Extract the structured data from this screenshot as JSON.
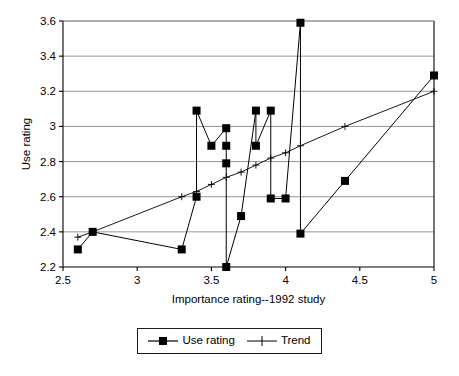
{
  "chart_data": {
    "type": "scatter",
    "title": "",
    "xlabel": "Importance rating--1992 study",
    "ylabel": "Use rating",
    "xlim": [
      2.5,
      5
    ],
    "ylim": [
      2.2,
      3.6
    ],
    "xticks": [
      "2.5",
      "3",
      "3.5",
      "4",
      "4.5",
      "5"
    ],
    "xtick_values": [
      2.5,
      3,
      3.5,
      4,
      4.5,
      5
    ],
    "yticks": [
      "2.2",
      "2.4",
      "2.6",
      "2.8",
      "3",
      "3.2",
      "3.4",
      "3.6"
    ],
    "ytick_values": [
      2.2,
      2.4,
      2.6,
      2.8,
      3,
      3.2,
      3.4,
      3.6
    ],
    "grid": "horizontal",
    "legend_position": "bottom-center",
    "series": [
      {
        "name": "Use rating",
        "marker": "filled-square",
        "color": "#000000",
        "x": [
          2.6,
          2.7,
          3.3,
          3.4,
          3.4,
          3.5,
          3.6,
          3.6,
          3.6,
          3.6,
          3.7,
          3.8,
          3.8,
          3.9,
          3.9,
          4.0,
          4.1,
          4.1,
          4.4,
          5.0
        ],
        "y": [
          2.3,
          2.4,
          2.3,
          2.6,
          3.09,
          2.89,
          2.99,
          2.89,
          2.79,
          2.2,
          2.49,
          3.09,
          2.89,
          3.09,
          2.59,
          2.59,
          3.59,
          2.39,
          2.69,
          3.29
        ]
      },
      {
        "name": "Trend",
        "marker": "plus",
        "color": "#000000",
        "x": [
          2.6,
          2.7,
          3.3,
          3.4,
          3.5,
          3.6,
          3.7,
          3.8,
          3.9,
          4.0,
          4.1,
          4.4,
          5.0
        ],
        "y": [
          2.37,
          2.4,
          2.6,
          2.63,
          2.67,
          2.71,
          2.74,
          2.78,
          2.82,
          2.85,
          2.89,
          3.0,
          3.2
        ]
      }
    ]
  },
  "legend": {
    "items": [
      {
        "label": "Use rating",
        "marker": "filled-square"
      },
      {
        "label": "Trend",
        "marker": "plus"
      }
    ]
  }
}
